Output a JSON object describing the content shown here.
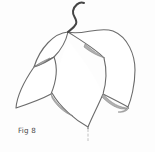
{
  "figure": {
    "label": "Fig 8",
    "colors": {
      "background": "#fdfdfd",
      "line": "#6b6b6b",
      "stem": "#454545",
      "shading": "#b0b0b0",
      "label_text": "#4a4a4a"
    },
    "paths": {
      "stem": "M84,3 C79,1 74,6 73,11 C72,16 78,19 76,24 C74,28 70,30 68,32",
      "right_petal": "M68,32 C82,36 98,26 113,31 C128,37 135,55 135,70 C135,85 131,100 128,107 C121,103 111,98 103,94 C106,84 107,70 104,58 C97,50 82,41 68,32 Z",
      "dome_petal": "M68,32 C54,33 40,48 34,67 C40,63 48,60 54,57 C61,50 66,41 68,32 Z",
      "center_petal_fill": "M52,93 C57,75 62,55 68,40 C80,55 95,75 103,94 C98,105 93,117 88,127 C73,119 59,106 52,93 Z",
      "center_edge_left": "M52,93 C60,107 75,120 88,127",
      "center_edge_right": "M103,94 C98,106 92,117 88,127",
      "left_petal": "M54,57 C47,62 40,65 34,67 C25,80 17,95 16,108 C28,104 42,99 51,94 C56,82 58,68 54,57 Z",
      "sliver_dome_tip": "M34,67 C39,63 45,60 50,58 C45,62 40,65 36,66 Z",
      "sliver_right_fold": "M85,44 C92,50 99,55 105,58 C97,56 89,51 84,47 Z",
      "sliver_left_notch": "M51,94 C56,103 64,111 73,116 C64,113 56,105 52,98 Z",
      "sliver_right_notch": "M103,94 C111,103 120,108 129,108 C119,112 108,103 102,97 Z",
      "sliver_right_tip": "M128,107 C126,110 122,112 118,112 C123,113 127,111 129,108 Z",
      "drip_line": "M88,129 L88,141"
    }
  }
}
